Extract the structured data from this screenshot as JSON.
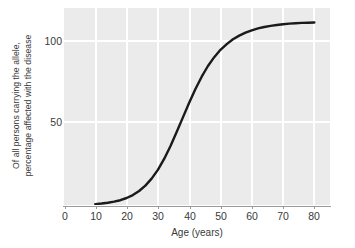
{
  "chart_data": {
    "type": "line",
    "title": "",
    "xlabel": "Age (years)",
    "ylabel_line1": "Of all persons carrying the allele,",
    "ylabel_line2": "percentage affected with the disease",
    "xlim": [
      0,
      85
    ],
    "ylim": [
      0,
      107
    ],
    "xticks": [
      0,
      10,
      20,
      30,
      40,
      50,
      60,
      70,
      80
    ],
    "xtick_labels": [
      "0",
      "10",
      "20",
      "30",
      "40",
      "50",
      "60",
      "70",
      "80"
    ],
    "yticks": [
      50,
      100
    ],
    "ytick_labels": [
      "50",
      "100"
    ],
    "grid": true,
    "grid_color": "#ffffff",
    "plot_background": "#ebebeb",
    "legend": "none",
    "series": [
      {
        "name": "Age-dependent penetrance",
        "color": "#1a1a1a",
        "line_width": 2.4,
        "x": [
          10,
          12,
          14,
          16,
          18,
          20,
          22,
          24,
          26,
          28,
          30,
          32,
          34,
          36,
          38,
          40,
          42,
          44,
          46,
          48,
          50,
          52,
          54,
          56,
          58,
          60,
          62,
          64,
          66,
          68,
          70,
          72,
          74,
          76,
          78,
          80
        ],
        "values": [
          0.5,
          0.8,
          1.2,
          1.8,
          2.6,
          3.8,
          5.4,
          7.6,
          10.5,
          14.3,
          19.1,
          25.0,
          31.9,
          39.6,
          47.6,
          55.5,
          63.0,
          69.7,
          75.5,
          80.3,
          84.3,
          87.4,
          90.0,
          92.0,
          93.6,
          94.9,
          95.9,
          96.7,
          97.3,
          97.8,
          98.2,
          98.5,
          98.7,
          98.9,
          99.0,
          99.1
        ]
      }
    ]
  },
  "axis": {
    "axis_line_color": "#9a9a9a"
  }
}
